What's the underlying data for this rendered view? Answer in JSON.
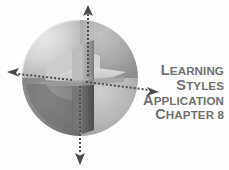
{
  "figure": {
    "name": "learning-styles-quadrant-sphere-figure",
    "background_color": "#fdfdfd",
    "width": 229,
    "height": 170
  },
  "title_block": {
    "color": "#6f6f6f",
    "align": "right",
    "lines": [
      {
        "id": "line-1",
        "text": "Learning",
        "first": "L",
        "rest": "EARNING"
      },
      {
        "id": "line-2",
        "text": "Styles",
        "first": "S",
        "rest": "TYLES"
      },
      {
        "id": "line-3",
        "text": "Application",
        "first": "A",
        "rest": "PPLICATION"
      },
      {
        "id": "line-4",
        "text": "Chapter 8",
        "first": "C",
        "rest": "HAPTER 8"
      }
    ]
  },
  "graphic": {
    "type": "cut-away-sphere",
    "description": "Grayscale 3D sphere sliced into four quadrants by a vertical and a horizontal cutting plane",
    "quadrants": [
      {
        "name": "upper-left",
        "fill": "#c9c9c9",
        "label": ""
      },
      {
        "name": "upper-right",
        "fill": "#aaaaaa",
        "label": ""
      },
      {
        "name": "lower-left",
        "fill": "#8a8a8a",
        "label": ""
      },
      {
        "name": "lower-right",
        "fill": "#bdbdbd",
        "label": ""
      }
    ],
    "cut_planes": [
      {
        "name": "vertical-cut-plane",
        "fill": "#909090"
      },
      {
        "name": "horizontal-cut-plane",
        "fill": "#d5d5d5"
      }
    ],
    "axes": [
      {
        "name": "axis-up",
        "direction": "up",
        "style": "dotted",
        "color": "#555555"
      },
      {
        "name": "axis-down",
        "direction": "down",
        "style": "dotted",
        "color": "#555555"
      },
      {
        "name": "axis-left",
        "direction": "left",
        "style": "dotted",
        "color": "#555555"
      },
      {
        "name": "axis-right",
        "direction": "right",
        "style": "dotted",
        "color": "#555555"
      }
    ]
  }
}
